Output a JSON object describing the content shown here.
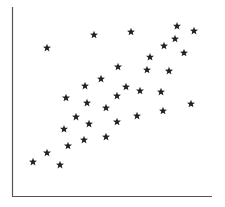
{
  "chart_data": {
    "type": "scatter",
    "title": "",
    "xlabel": "",
    "ylabel": "",
    "xlim": [
      0,
      10
    ],
    "ylim": [
      0,
      10
    ],
    "grid": false,
    "legend": null,
    "marker": "star",
    "marker_color": "#222222",
    "axis_color": "#555555",
    "ticks": "none",
    "series": [
      {
        "name": "points",
        "points": [
          {
            "x": 1.75,
            "y": 7.83
          },
          {
            "x": 4.1,
            "y": 8.52
          },
          {
            "x": 5.95,
            "y": 8.68
          },
          {
            "x": 8.25,
            "y": 8.99
          },
          {
            "x": 9.1,
            "y": 8.73
          },
          {
            "x": 8.15,
            "y": 8.31
          },
          {
            "x": 7.6,
            "y": 7.94
          },
          {
            "x": 8.6,
            "y": 7.57
          },
          {
            "x": 6.9,
            "y": 7.35
          },
          {
            "x": 6.75,
            "y": 6.67
          },
          {
            "x": 7.85,
            "y": 6.61
          },
          {
            "x": 5.3,
            "y": 6.83
          },
          {
            "x": 4.45,
            "y": 6.19
          },
          {
            "x": 3.65,
            "y": 5.82
          },
          {
            "x": 5.7,
            "y": 5.77
          },
          {
            "x": 6.4,
            "y": 5.56
          },
          {
            "x": 7.45,
            "y": 5.5
          },
          {
            "x": 2.7,
            "y": 5.19
          },
          {
            "x": 5.25,
            "y": 5.29
          },
          {
            "x": 3.75,
            "y": 4.92
          },
          {
            "x": 4.7,
            "y": 4.66
          },
          {
            "x": 8.95,
            "y": 4.87
          },
          {
            "x": 7.55,
            "y": 4.5
          },
          {
            "x": 6.25,
            "y": 4.23
          },
          {
            "x": 3.2,
            "y": 4.18
          },
          {
            "x": 3.85,
            "y": 3.81
          },
          {
            "x": 5.25,
            "y": 3.92
          },
          {
            "x": 2.6,
            "y": 3.54
          },
          {
            "x": 3.6,
            "y": 2.96
          },
          {
            "x": 4.7,
            "y": 3.12
          },
          {
            "x": 2.8,
            "y": 2.65
          },
          {
            "x": 1.75,
            "y": 2.28
          },
          {
            "x": 1.05,
            "y": 1.8
          },
          {
            "x": 2.4,
            "y": 1.64
          }
        ]
      }
    ]
  }
}
